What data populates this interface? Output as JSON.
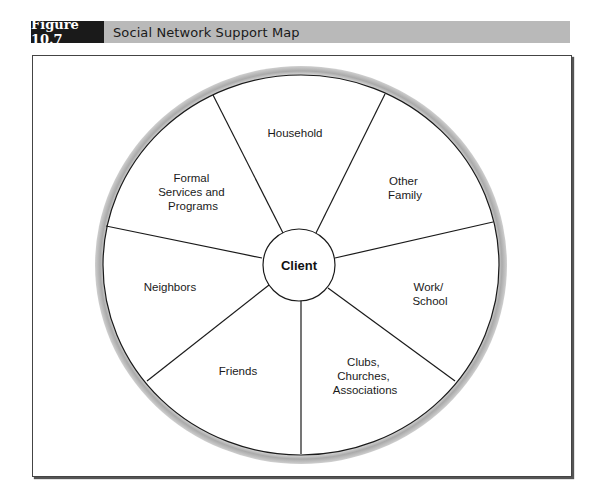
{
  "figure": {
    "number": "Figure 10.7",
    "title": "Social Network Support Map"
  },
  "diagram": {
    "center_label": "Client",
    "sectors": [
      {
        "name": "household",
        "lines": [
          "Household"
        ]
      },
      {
        "name": "other-family",
        "lines": [
          "Other",
          "Family"
        ]
      },
      {
        "name": "work-school",
        "lines": [
          "Work/",
          "School"
        ]
      },
      {
        "name": "clubs-churches-associations",
        "lines": [
          "Clubs,",
          "Churches,",
          "Associations"
        ]
      },
      {
        "name": "friends",
        "lines": [
          "Friends"
        ]
      },
      {
        "name": "neighbors",
        "lines": [
          "Neighbors"
        ]
      },
      {
        "name": "formal-services",
        "lines": [
          "Formal",
          "Services and",
          "Programs"
        ]
      }
    ]
  },
  "colors": {
    "header_bar": "#b9b9b9",
    "label_box": "#1a1a1a",
    "ring_gray": "#b5b5b5",
    "line": "#1a1a1a"
  }
}
